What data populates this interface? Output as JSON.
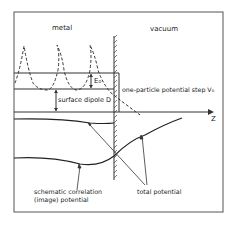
{
  "diagram": {
    "labels": {
      "metal": "metal",
      "vacuum": "vacuum",
      "e0": "E₀",
      "surface_dipole": "surface dipole D",
      "potential_step": "one-particle potential step V₀",
      "z_axis": "Z",
      "correlation_line1": "schematic correlation",
      "correlation_line2": "(image) potential",
      "total_potential": "total potential"
    },
    "colors": {
      "line": "#2a2a2a",
      "background": "#ffffff"
    }
  }
}
